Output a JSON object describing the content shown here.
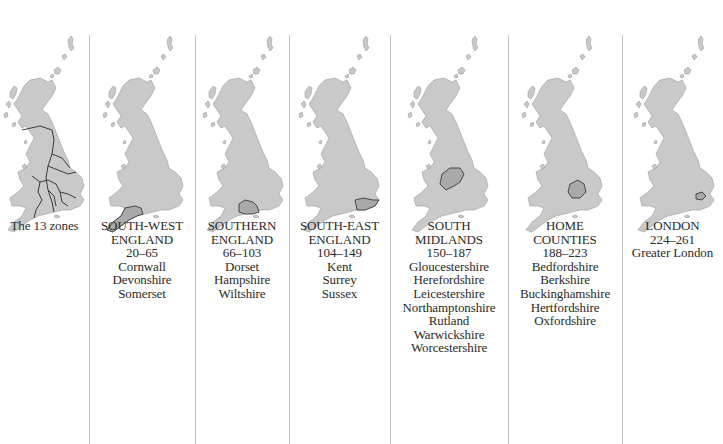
{
  "colors": {
    "land": "#c9c9c9",
    "land_stroke": "#9a9a9a",
    "highlight": "#a9a9a9",
    "boundary": "#3a3a3a",
    "separator": "#c4c4c4",
    "text": "#2a2a2a"
  },
  "panels": [
    {
      "id": "all-zones",
      "title_lines": [
        "The 13 zones"
      ],
      "range": "",
      "counties": [],
      "highlight": "all-boundaries"
    },
    {
      "id": "south-west-england",
      "title_lines": [
        "SOUTH-WEST",
        "ENGLAND"
      ],
      "range": "20–65",
      "counties": [
        "Cornwall",
        "Devonshire",
        "Somerset"
      ],
      "highlight": "south-west"
    },
    {
      "id": "southern-england",
      "title_lines": [
        "SOUTHERN",
        "ENGLAND"
      ],
      "range": "66–103",
      "counties": [
        "Dorset",
        "Hampshire",
        "Wiltshire"
      ],
      "highlight": "southern"
    },
    {
      "id": "south-east-england",
      "title_lines": [
        "SOUTH-EAST",
        "ENGLAND"
      ],
      "range": "104–149",
      "counties": [
        "Kent",
        "Surrey",
        "Sussex"
      ],
      "highlight": "south-east"
    },
    {
      "id": "south-midlands",
      "title_lines": [
        "SOUTH",
        "MIDLANDS"
      ],
      "range": "150–187",
      "counties": [
        "Gloucestershire",
        "Herefordshire",
        "Leicestershire",
        "Northamptonshire",
        "Rutland",
        "Warwickshire",
        "Worcestershire"
      ],
      "highlight": "south-midlands"
    },
    {
      "id": "home-counties",
      "title_lines": [
        "HOME",
        "COUNTIES"
      ],
      "range": "188–223",
      "counties": [
        "Bedfordshire",
        "Berkshire",
        "Buckinghamshire",
        "Hertfordshire",
        "Oxfordshire"
      ],
      "highlight": "home-counties"
    },
    {
      "id": "london",
      "title_lines": [
        "LONDON"
      ],
      "range": "224–261",
      "counties": [
        "Greater London"
      ],
      "highlight": "london"
    }
  ]
}
